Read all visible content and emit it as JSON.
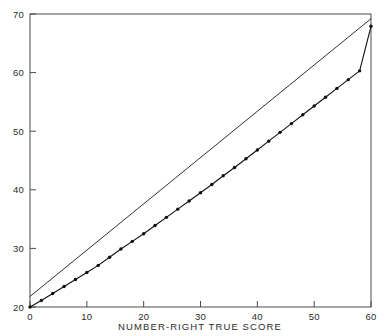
{
  "chart_data": {
    "type": "line",
    "title": "",
    "xlabel": "NUMBER-RIGHT TRUE SCORE",
    "ylabel": "",
    "xlim": [
      0,
      60
    ],
    "ylim": [
      20,
      70
    ],
    "xticks": [
      0,
      10,
      20,
      30,
      40,
      50,
      60
    ],
    "yticks": [
      20,
      30,
      40,
      50,
      60,
      70
    ],
    "xticklabels": [
      "0",
      "10",
      "20",
      "30",
      "40",
      "50",
      "60"
    ],
    "yticklabels": [
      "20",
      "30",
      "40",
      "50",
      "60",
      "70"
    ],
    "grid": false,
    "legend": "none",
    "frame": "box",
    "series": [
      {
        "name": "reference-line",
        "style": "solid",
        "marker": "none",
        "color": "#1a1a1a",
        "x": [
          0,
          60
        ],
        "y": [
          21.8,
          69.2
        ]
      },
      {
        "name": "observed-curve",
        "style": "solid-with-dot-markers",
        "marker": "dot",
        "color": "#111111",
        "x": [
          0,
          2,
          4,
          6,
          8,
          10,
          12,
          14,
          16,
          18,
          20,
          22,
          24,
          26,
          28,
          30,
          32,
          34,
          36,
          38,
          40,
          42,
          44,
          46,
          48,
          50,
          52,
          54,
          56,
          58,
          60
        ],
        "y": [
          20.0,
          21.1,
          22.3,
          23.5,
          24.7,
          25.9,
          27.1,
          28.5,
          29.9,
          31.2,
          32.5,
          33.9,
          35.3,
          36.7,
          38.1,
          39.5,
          40.9,
          42.4,
          43.8,
          45.3,
          46.8,
          48.3,
          49.8,
          51.3,
          52.8,
          54.3,
          55.8,
          57.3,
          58.8,
          60.3,
          67.9
        ]
      }
    ]
  },
  "axes": {
    "x_axis_name": "x-axis",
    "y_axis_name": "y-axis"
  }
}
